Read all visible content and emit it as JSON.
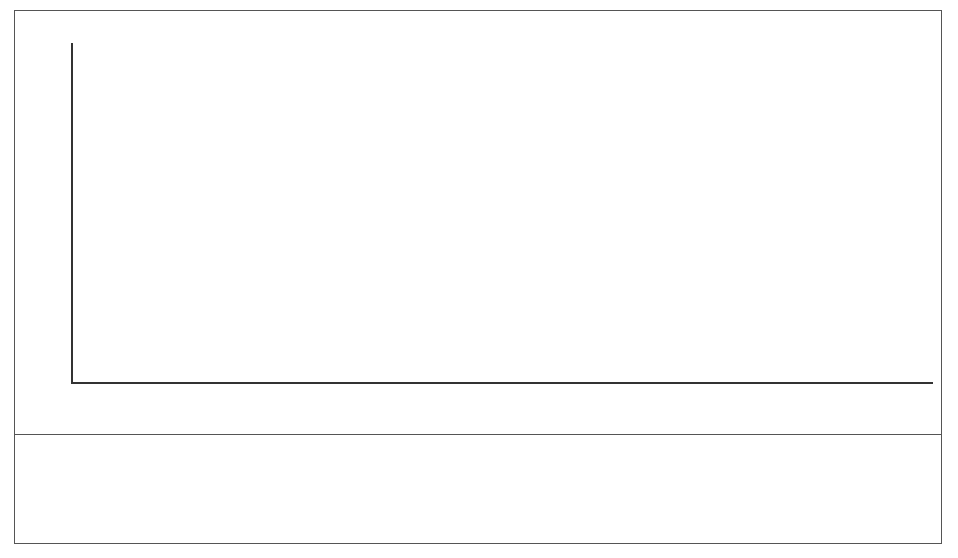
{
  "chart_data": {
    "type": "bar",
    "stacked": true,
    "title": "",
    "subtitle": "",
    "xlabel": "",
    "ylabel": "",
    "grid": false,
    "legend_position": "bottom-left",
    "ylim": [
      0,
      40
    ],
    "yticks": [
      0,
      5,
      10,
      15,
      20,
      25,
      30,
      35,
      40
    ],
    "ytick_labels": [
      "0",
      "5",
      "10",
      "15",
      "20",
      "25",
      "30",
      "35",
      "40"
    ],
    "minor_yticks": [
      2.5,
      7.5,
      12.5,
      17.5,
      22.5,
      27.5,
      32.5,
      37.5
    ],
    "categories": [
      "2002",
      "2003",
      "2004",
      "2005",
      "2006",
      "2007",
      "2008",
      "2009",
      "2010",
      "2011",
      "2012",
      "2013",
      "2014",
      "2015",
      "2016",
      "2017",
      "2018",
      "2019",
      "2020"
    ],
    "xtick_labels": [
      "2002",
      "",
      "2004",
      "",
      "2006",
      "",
      "2008",
      "",
      "2010",
      "",
      "2012",
      "",
      "2014",
      "",
      "2016",
      "",
      "2018",
      "",
      "2020"
    ],
    "series": [
      {
        "name": "Betriebliche Altersvorsorge",
        "fill": "dotted",
        "values": [
          4.8,
          9.2,
          11.7,
          14.6,
          17.3,
          20.5,
          21.0,
          21.5,
          22.2,
          23.1,
          23.7,
          24.5,
          25.1,
          25.6,
          26.3,
          26.7,
          27.3,
          28.0,
          28.5
        ]
      },
      {
        "name": "Private Altersvorsorge",
        "fill": "white",
        "values": [
          1.1,
          1.4,
          2.1,
          2.5,
          3.4,
          3.7,
          4.2,
          4.6,
          5.2,
          5.7,
          6.5,
          7.2,
          7.8,
          8.1,
          8.3,
          8.5,
          8.7,
          8.8,
          9.0
        ]
      }
    ],
    "totals": [
      5.9,
      10.6,
      13.8,
      17.1,
      20.7,
      24.2,
      25.2,
      26.1,
      27.4,
      28.8,
      30.2,
      31.7,
      32.9,
      33.7,
      34.6,
      35.2,
      36.0,
      36.8,
      37.5
    ]
  },
  "legend": {
    "items": [
      {
        "label": "Private Altersvorsorge",
        "swatch": "white-square-icon"
      },
      {
        "label": "Betriebliche Altersvorsorge",
        "swatch": "dotted-square-icon"
      }
    ]
  },
  "source": {
    "text": "Quelle : Dresdner Bank (2001), S. 36."
  }
}
